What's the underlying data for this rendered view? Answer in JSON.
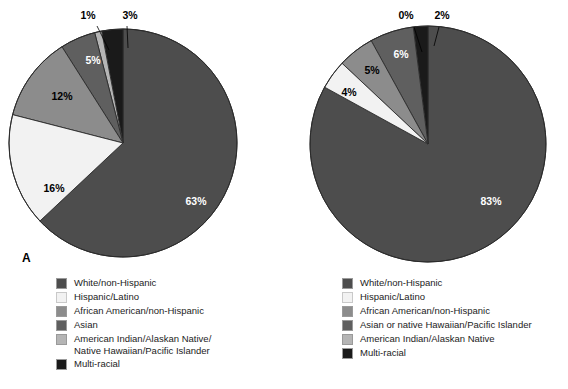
{
  "figure": {
    "panels": [
      {
        "letter": "A"
      },
      {
        "letter": "B"
      }
    ]
  },
  "colors": {
    "white_non_hispanic": "#4d4d4d",
    "hispanic_latino": "#f2f2f2",
    "african_american": "#8c8c8c",
    "asian": "#5f5f5f",
    "american_indian": "#b5b5b5",
    "multi_racial": "#1a1a1a",
    "outline": "#2b2b2b",
    "background": "#ffffff"
  },
  "chart_data": [
    {
      "type": "pie",
      "title": "A",
      "panel": "A",
      "categories": [
        "White/non-Hispanic",
        "Hispanic/Latino",
        "African American/non-Hispanic",
        "Asian",
        "American Indian/Alaskan Native/\nNative Hawaiian/Pacific Islander",
        "Multi-racial"
      ],
      "values": [
        63,
        16,
        12,
        5,
        1,
        3
      ],
      "labels": [
        "63%",
        "16%",
        "12%",
        "5%",
        "1%",
        "3%"
      ],
      "colors": [
        "#4d4d4d",
        "#f2f2f2",
        "#8c8c8c",
        "#5f5f5f",
        "#b5b5b5",
        "#1a1a1a"
      ],
      "legend_position": "bottom",
      "units": "percent"
    },
    {
      "type": "pie",
      "title": "B",
      "panel": "B",
      "categories": [
        "White/non-Hispanic",
        "Hispanic/Latino",
        "African American/non-Hispanic",
        "Asian or native Hawaiian/Pacific Islander",
        "American Indian/Alaskan Native",
        "Multi-racial"
      ],
      "values": [
        83,
        4,
        5,
        6,
        0,
        2
      ],
      "labels": [
        "83%",
        "4%",
        "5%",
        "6%",
        "0%",
        "2%"
      ],
      "colors": [
        "#4d4d4d",
        "#f2f2f2",
        "#8c8c8c",
        "#5f5f5f",
        "#b5b5b5",
        "#1a1a1a"
      ],
      "legend_position": "bottom",
      "units": "percent"
    }
  ],
  "legend_a": {
    "items": [
      {
        "label": "White/non-Hispanic",
        "color": "#4d4d4d"
      },
      {
        "label": "Hispanic/Latino",
        "color": "#f2f2f2"
      },
      {
        "label": "African American/non-Hispanic",
        "color": "#8c8c8c"
      },
      {
        "label": "Asian",
        "color": "#5f5f5f"
      },
      {
        "label": "American Indian/Alaskan Native/\n     Native Hawaiian/Pacific Islander",
        "color": "#b5b5b5"
      },
      {
        "label": "Multi-racial",
        "color": "#1a1a1a"
      }
    ]
  },
  "legend_b": {
    "items": [
      {
        "label": "White/non-Hispanic",
        "color": "#4d4d4d"
      },
      {
        "label": "Hispanic/Latino",
        "color": "#f2f2f2"
      },
      {
        "label": "African American/non-Hispanic",
        "color": "#8c8c8c"
      },
      {
        "label": "Asian or native Hawaiian/Pacific Islander",
        "color": "#5f5f5f"
      },
      {
        "label": "American Indian/Alaskan Native",
        "color": "#b5b5b5"
      },
      {
        "label": "Multi-racial",
        "color": "#1a1a1a"
      }
    ]
  },
  "pie_a_labels": {
    "s63": "63%",
    "s16": "16%",
    "s12": "12%",
    "s5": "5%",
    "s1": "1%",
    "s3": "3%"
  },
  "pie_b_labels": {
    "s83": "83%",
    "s4": "4%",
    "s5": "5%",
    "s6": "6%",
    "s0": "0%",
    "s2": "2%"
  }
}
